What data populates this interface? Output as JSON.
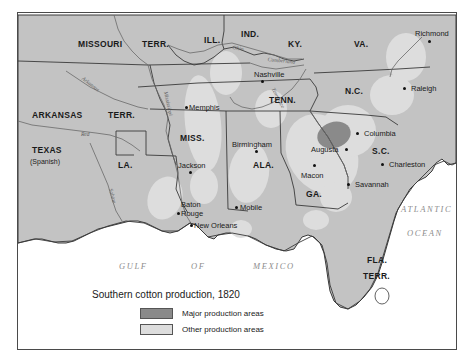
{
  "figure": {
    "title": "Southern cotton production, 1820",
    "domain": "historical thematic map of the southern United States"
  },
  "colors": {
    "land": "#c3c3c3",
    "water": "#ffffff",
    "major_production": "#8a8a8a",
    "other_production": "#dddddd",
    "border_line": "#3a3a3a",
    "frame": "#4a4a4a",
    "text": "#1a1a1a",
    "water_label": "#8d8d8d"
  },
  "legend": {
    "title": "Southern cotton production, 1820",
    "items": [
      {
        "label": "Major production areas",
        "color": "#8a8a8a"
      },
      {
        "label": "Other production areas",
        "color": "#dddddd"
      }
    ]
  },
  "states": [
    {
      "id": "missouri",
      "label": "MISSOURI",
      "x": 60,
      "y": 27
    },
    {
      "id": "missouri-terr",
      "label": "TERR.",
      "x": 124,
      "y": 27
    },
    {
      "id": "arkansas",
      "label": "ARKANSAS",
      "x": 14,
      "y": 98
    },
    {
      "id": "arkansas-terr",
      "label": "TERR.",
      "x": 90,
      "y": 98
    },
    {
      "id": "texas",
      "label": "TEXAS",
      "x": 14,
      "y": 133
    },
    {
      "id": "texas-sub",
      "label": "(Spanish)",
      "x": 12,
      "y": 145
    },
    {
      "id": "louisiana",
      "label": "LA.",
      "x": 100,
      "y": 148
    },
    {
      "id": "mississippi",
      "label": "MISS.",
      "x": 162,
      "y": 121
    },
    {
      "id": "alabama",
      "label": "ALA.",
      "x": 235,
      "y": 148
    },
    {
      "id": "georgia",
      "label": "GA.",
      "x": 288,
      "y": 177
    },
    {
      "id": "florida",
      "label": "FLA.",
      "x": 349,
      "y": 243
    },
    {
      "id": "florida-terr",
      "label": "TERR.",
      "x": 345,
      "y": 259
    },
    {
      "id": "tennessee",
      "label": "TENN.",
      "x": 251,
      "y": 83
    },
    {
      "id": "kentucky",
      "label": "KY.",
      "x": 270,
      "y": 27
    },
    {
      "id": "illinois",
      "label": "ILL.",
      "x": 186,
      "y": 23
    },
    {
      "id": "indiana",
      "label": "IND.",
      "x": 223,
      "y": 17
    },
    {
      "id": "virginia",
      "label": "VA.",
      "x": 336,
      "y": 27
    },
    {
      "id": "north-carolina",
      "label": "N.C.",
      "x": 327,
      "y": 74
    },
    {
      "id": "south-carolina",
      "label": "S.C.",
      "x": 354,
      "y": 134
    }
  ],
  "cities": [
    {
      "id": "memphis",
      "label": "Memphis",
      "label_x": 171,
      "label_y": 91,
      "dot_x": 172,
      "dot_y": 98
    },
    {
      "id": "nashville",
      "label": "Nashville",
      "label_x": 236,
      "label_y": 58,
      "dot_x": 243,
      "dot_y": 67
    },
    {
      "id": "jackson",
      "label": "Jackson",
      "label_x": 160,
      "label_y": 149,
      "dot_x": 171,
      "dot_y": 158
    },
    {
      "id": "birmingham",
      "label": "Birmingham",
      "label_x": 214,
      "label_y": 128,
      "dot_x": 237,
      "dot_y": 137
    },
    {
      "id": "baton-rouge",
      "label": "Baton",
      "label_x": 161,
      "label_y": 189,
      "dot_x": 163,
      "dot_y": 204
    },
    {
      "id": "baton-rouge-2",
      "label": "Rouge",
      "label_x": 162,
      "label_y": 198,
      "dot_x": 0,
      "dot_y": 0
    },
    {
      "id": "new-orleans",
      "label": "New Orleans",
      "label_x": 175,
      "label_y": 214,
      "dot_x": 174,
      "dot_y": 214
    },
    {
      "id": "mobile",
      "label": "Mobile",
      "label_x": 222,
      "label_y": 194,
      "dot_x": 216,
      "dot_y": 197
    },
    {
      "id": "macon",
      "label": "Macon",
      "label_x": 288,
      "label_y": 161,
      "dot_x": 300,
      "dot_y": 151
    },
    {
      "id": "augusta",
      "label": "Augusta",
      "label_x": 299,
      "label_y": 136,
      "dot_x": 330,
      "dot_y": 136
    },
    {
      "id": "columbia",
      "label": "Columbia",
      "label_x": 345,
      "label_y": 119,
      "dot_x": 338,
      "dot_y": 121
    },
    {
      "id": "charleston",
      "label": "Charleston",
      "label_x": 370,
      "label_y": 149,
      "dot_x": 362,
      "dot_y": 151
    },
    {
      "id": "savannah",
      "label": "Savannah",
      "label_x": 336,
      "label_y": 169,
      "dot_x": 329,
      "dot_y": 171
    },
    {
      "id": "raleigh",
      "label": "Raleigh",
      "label_x": 392,
      "label_y": 73,
      "dot_x": 385,
      "dot_y": 75
    },
    {
      "id": "richmond",
      "label": "Richmond",
      "label_x": 397,
      "label_y": 18,
      "dot_x": 410,
      "dot_y": 27
    }
  ],
  "water_labels": [
    {
      "id": "gulf",
      "label": "GULF",
      "x": 101,
      "y": 249
    },
    {
      "id": "of",
      "label": "OF",
      "x": 173,
      "y": 249
    },
    {
      "id": "mexico",
      "label": "MEXICO",
      "x": 235,
      "y": 249
    },
    {
      "id": "atlantic",
      "label": "ATLANTIC",
      "x": 383,
      "y": 192
    },
    {
      "id": "ocean",
      "label": "OCEAN",
      "x": 389,
      "y": 216
    }
  ],
  "river_labels": [
    {
      "id": "arkansas-river",
      "label": "Arkansas",
      "x": 66,
      "y": 63,
      "rot": 38
    },
    {
      "id": "red-river",
      "label": "Red",
      "x": 63,
      "y": 119,
      "rot": 0
    },
    {
      "id": "mississippi-river",
      "label": "Mississippi",
      "x": 156,
      "y": 78,
      "rot": 78
    },
    {
      "id": "ohio-river",
      "label": "Ohio",
      "x": 215,
      "y": 32,
      "rot": 10
    },
    {
      "id": "cumberland-river",
      "label": "Cumberland",
      "x": 254,
      "y": 44,
      "rot": 6
    },
    {
      "id": "tennessee-river",
      "label": "Tennessee",
      "x": 257,
      "y": 74,
      "rot": 62
    },
    {
      "id": "sabine-river",
      "label": "Sabine",
      "x": 95,
      "y": 175,
      "rot": 76
    }
  ]
}
